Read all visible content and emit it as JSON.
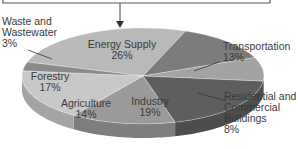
{
  "chart_data": {
    "type": "pie",
    "style": "3d",
    "title": "",
    "categories": [
      "Energy Supply",
      "Transportation",
      "Residential and Commercial Buildings",
      "Industry",
      "Agriculture",
      "Forestry",
      "Waste and Wastewater"
    ],
    "values": [
      26,
      13,
      8,
      19,
      14,
      17,
      3
    ],
    "unit": "%",
    "colors": {
      "Energy Supply": "#b9b9b9",
      "Transportation": "#7c7c7c",
      "Residential and Commercial Buildings": "#a3a3a3",
      "Industry": "#5e5e5e",
      "Agriculture": "#9a9a9a",
      "Forestry": "#c8c8c8",
      "Waste and Wastewater": "#8a8a8a"
    }
  },
  "labels": {
    "energy": {
      "name": "Energy Supply",
      "pct": "26%"
    },
    "transport": {
      "name": "Transportation",
      "pct": "13%"
    },
    "residential": {
      "line1": "Residential and",
      "line2": "Commercial",
      "line3": "Buildings",
      "pct": "8%"
    },
    "industry": {
      "name": "Industry",
      "pct": "19%"
    },
    "agriculture": {
      "name": "Agriculture",
      "pct": "14%"
    },
    "forestry": {
      "name": "Forestry",
      "pct": "17%"
    },
    "waste": {
      "line1": "Waste and",
      "line2": "Wastewater",
      "pct": "3%"
    }
  }
}
